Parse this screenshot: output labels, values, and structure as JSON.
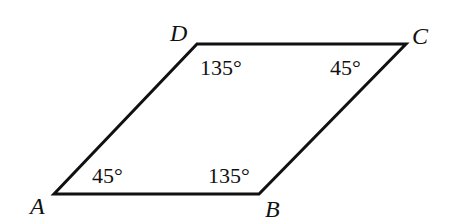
{
  "diagram": {
    "type": "parallelogram",
    "stroke_color": "#111111",
    "vertices": [
      {
        "name": "A",
        "x": 54,
        "y": 194,
        "label_x": 30,
        "label_y": 214
      },
      {
        "name": "B",
        "x": 259,
        "y": 194,
        "label_x": 265,
        "label_y": 217
      },
      {
        "name": "C",
        "x": 406,
        "y": 44,
        "label_x": 412,
        "label_y": 44
      },
      {
        "name": "D",
        "x": 197,
        "y": 44,
        "label_x": 170,
        "label_y": 41
      }
    ],
    "angles": [
      {
        "vertex": "A",
        "text": "45°",
        "x": 92,
        "y": 183
      },
      {
        "vertex": "B",
        "text": "135°",
        "x": 208,
        "y": 183
      },
      {
        "vertex": "C",
        "text": "45°",
        "x": 330,
        "y": 75
      },
      {
        "vertex": "D",
        "text": "135°",
        "x": 200,
        "y": 75
      }
    ]
  }
}
